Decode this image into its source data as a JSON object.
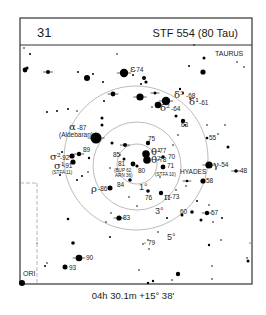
{
  "header": {
    "chart_number": "31",
    "title": "STF 554 (80 Tau)"
  },
  "caption": "04h 30.1m  +15° 38'",
  "constellations": {
    "main": "TAURUS",
    "neighbor": "ORI",
    "cluster": "HYADES"
  },
  "circles": {
    "center": [
      137,
      163
    ],
    "rings": [
      {
        "label": "1°",
        "r": 20
      },
      {
        "label": "3°",
        "r": 44
      },
      {
        "label": "5°",
        "r": 71
      }
    ]
  },
  "labels": {
    "epsilon": {
      "greek": "ε",
      "num": "-74"
    },
    "delta3": {
      "greek": "δ³",
      "num": "-68"
    },
    "delta2": {
      "greek": "δ²",
      "num": "-64"
    },
    "delta1": {
      "greek": "δ¹",
      "num": "-61"
    },
    "alpha": {
      "greek": "α",
      "num": "-87",
      "name": "(Aldebaran)"
    },
    "sigma2": {
      "greek": "σ²",
      "num": "-92"
    },
    "sigma1": {
      "greek": "σ¹",
      "num": "-91",
      "name": "(STFA 11)"
    },
    "rho": {
      "greek": "ρ",
      "num": "-86"
    },
    "theta1": {
      "greek": "θ¹",
      "num": "-77"
    },
    "theta2": {
      "greek": "θ²",
      "num": "-78"
    },
    "gamma": {
      "greek": "γ",
      "num": "-54"
    },
    "pi": {
      "greek": "π",
      "num": "-73"
    },
    "n89": "89",
    "n85": "85",
    "n81": "81",
    "n80": "80",
    "n84": "84",
    "n75": "75",
    "n70": "70",
    "n71": "71",
    "n63": "63",
    "n55": "55",
    "n48": "48",
    "n58": "58",
    "n76": "76",
    "n60": "60",
    "n57": "57",
    "n83": "83",
    "n79": "79",
    "n90": "90",
    "n93": "93",
    "bup": "(BUP 62,",
    "arn": "ARN 36)",
    "stfa10": "(STFA 10)"
  },
  "stars": [
    {
      "x": 124,
      "y": 73,
      "r": 4.2,
      "tick": true
    },
    {
      "x": 133,
      "y": 75,
      "r": 1
    },
    {
      "x": 144,
      "y": 78,
      "r": 2
    },
    {
      "x": 146,
      "y": 82,
      "r": 1.6
    },
    {
      "x": 141,
      "y": 84,
      "r": 1
    },
    {
      "x": 189,
      "y": 66,
      "r": 1
    },
    {
      "x": 204,
      "y": 58,
      "r": 1.5
    },
    {
      "x": 203,
      "y": 72,
      "r": 2.6
    },
    {
      "x": 237,
      "y": 62,
      "r": 0.8
    },
    {
      "x": 244,
      "y": 67,
      "r": 0.8
    },
    {
      "x": 24,
      "y": 48,
      "r": 0.8
    },
    {
      "x": 30,
      "y": 54,
      "r": 1
    },
    {
      "x": 117,
      "y": 54,
      "r": 0.8
    },
    {
      "x": 194,
      "y": 45,
      "r": 0.8
    },
    {
      "x": 25,
      "y": 70,
      "r": 2.4
    },
    {
      "x": 27,
      "y": 68,
      "r": 1.6
    },
    {
      "x": 48,
      "y": 72,
      "r": 2,
      "tick": true
    },
    {
      "x": 78,
      "y": 72,
      "r": 1
    },
    {
      "x": 87,
      "y": 78,
      "r": 3
    },
    {
      "x": 93,
      "y": 74,
      "r": 1
    },
    {
      "x": 103,
      "y": 82,
      "r": 1
    },
    {
      "x": 113,
      "y": 94,
      "r": 2.4,
      "tick": true
    },
    {
      "x": 104,
      "y": 101,
      "r": 1
    },
    {
      "x": 155,
      "y": 93,
      "r": 1.5,
      "tick": true
    },
    {
      "x": 140,
      "y": 97,
      "r": 3.6,
      "tick": true
    },
    {
      "x": 180,
      "y": 89,
      "r": 1.2
    },
    {
      "x": 183,
      "y": 93,
      "r": 1
    },
    {
      "x": 190,
      "y": 99,
      "r": 0.8
    },
    {
      "x": 158,
      "y": 105,
      "r": 3.3
    },
    {
      "x": 166,
      "y": 101,
      "r": 4.2,
      "tick": true
    },
    {
      "x": 152,
      "y": 107,
      "r": 0.8
    },
    {
      "x": 47,
      "y": 112,
      "r": 1
    },
    {
      "x": 57,
      "y": 111,
      "r": 1
    },
    {
      "x": 68,
      "y": 109,
      "r": 1
    },
    {
      "x": 77,
      "y": 111,
      "r": 0.8
    },
    {
      "x": 102,
      "y": 118,
      "r": 1.5
    },
    {
      "x": 102,
      "y": 125,
      "r": 1.5
    },
    {
      "x": 176,
      "y": 116,
      "r": 1.5
    },
    {
      "x": 183,
      "y": 121,
      "r": 2.2
    },
    {
      "x": 185,
      "y": 125,
      "r": 1
    },
    {
      "x": 178,
      "y": 135,
      "r": 0.8
    },
    {
      "x": 207,
      "y": 125,
      "r": 0.8
    },
    {
      "x": 225,
      "y": 125,
      "r": 0.8
    },
    {
      "x": 207,
      "y": 138,
      "r": 1.3
    },
    {
      "x": 218,
      "y": 134,
      "r": 0.8
    },
    {
      "x": 228,
      "y": 147,
      "r": 1.5
    },
    {
      "x": 96,
      "y": 138,
      "r": 5.5,
      "tick": true
    },
    {
      "x": 112,
      "y": 143,
      "r": 1.5
    },
    {
      "x": 79,
      "y": 154,
      "r": 2.2,
      "tick": true
    },
    {
      "x": 89,
      "y": 158,
      "r": 1.2
    },
    {
      "x": 72,
      "y": 156,
      "r": 2.6
    },
    {
      "x": 73,
      "y": 162,
      "r": 2.6
    },
    {
      "x": 62,
      "y": 152,
      "r": 1
    },
    {
      "x": 125,
      "y": 145,
      "r": 2,
      "tick": true
    },
    {
      "x": 148,
      "y": 143,
      "r": 2.2
    },
    {
      "x": 120,
      "y": 155,
      "r": 0.8
    },
    {
      "x": 124,
      "y": 159,
      "r": 1.5
    },
    {
      "x": 133,
      "y": 164,
      "r": 2.4
    },
    {
      "x": 137,
      "y": 166,
      "r": 1.6
    },
    {
      "x": 146,
      "y": 154,
      "r": 3.8
    },
    {
      "x": 147,
      "y": 160,
      "r": 3.8
    },
    {
      "x": 163,
      "y": 157,
      "r": 1.8
    },
    {
      "x": 163,
      "y": 167,
      "r": 2.4
    },
    {
      "x": 173,
      "y": 145,
      "r": 0.8
    },
    {
      "x": 160,
      "y": 177,
      "r": 0.8
    },
    {
      "x": 209,
      "y": 165,
      "r": 3.6,
      "tick": true
    },
    {
      "x": 236,
      "y": 171,
      "r": 1.8,
      "tick": true
    },
    {
      "x": 203,
      "y": 181,
      "r": 2.6
    },
    {
      "x": 187,
      "y": 181,
      "r": 1.3,
      "tick": true
    },
    {
      "x": 186,
      "y": 186,
      "r": 0.8
    },
    {
      "x": 176,
      "y": 190,
      "r": 0.8
    },
    {
      "x": 130,
      "y": 180,
      "r": 1.8
    },
    {
      "x": 110,
      "y": 168,
      "r": 0.8
    },
    {
      "x": 82,
      "y": 176,
      "r": 1
    },
    {
      "x": 88,
      "y": 172,
      "r": 0.8
    },
    {
      "x": 77,
      "y": 180,
      "r": 1
    },
    {
      "x": 60,
      "y": 175,
      "r": 1
    },
    {
      "x": 110,
      "y": 188,
      "r": 2.5
    },
    {
      "x": 148,
      "y": 191,
      "r": 1.8
    },
    {
      "x": 161,
      "y": 193,
      "r": 2.2
    },
    {
      "x": 129,
      "y": 197,
      "r": 0.8
    },
    {
      "x": 137,
      "y": 206,
      "r": 0.8
    },
    {
      "x": 197,
      "y": 201,
      "r": 1
    },
    {
      "x": 209,
      "y": 205,
      "r": 0.8
    },
    {
      "x": 192,
      "y": 212,
      "r": 1.8
    },
    {
      "x": 207,
      "y": 213,
      "r": 2.2,
      "tick": true
    },
    {
      "x": 201,
      "y": 220,
      "r": 1.5
    },
    {
      "x": 222,
      "y": 218,
      "r": 1
    },
    {
      "x": 213,
      "y": 222,
      "r": 0.8
    },
    {
      "x": 182,
      "y": 215,
      "r": 1.5
    },
    {
      "x": 111,
      "y": 213,
      "r": 0.8
    },
    {
      "x": 119,
      "y": 218,
      "r": 2.6,
      "tick": true
    },
    {
      "x": 167,
      "y": 218,
      "r": 1
    },
    {
      "x": 158,
      "y": 232,
      "r": 0.8
    },
    {
      "x": 106,
      "y": 222,
      "r": 0.8
    },
    {
      "x": 149,
      "y": 249,
      "r": 0.8
    },
    {
      "x": 148,
      "y": 240,
      "r": 0.8
    },
    {
      "x": 143,
      "y": 244,
      "r": 0.8
    },
    {
      "x": 110,
      "y": 237,
      "r": 1
    },
    {
      "x": 145,
      "y": 243,
      "r": 0.6
    },
    {
      "x": 68,
      "y": 219,
      "r": 1.3
    },
    {
      "x": 73,
      "y": 243,
      "r": 1.8
    },
    {
      "x": 79,
      "y": 258,
      "r": 3.3,
      "tick": true
    },
    {
      "x": 65,
      "y": 267,
      "r": 2.5
    },
    {
      "x": 45,
      "y": 266,
      "r": 1
    },
    {
      "x": 47,
      "y": 263,
      "r": 0.8
    },
    {
      "x": 37,
      "y": 243,
      "r": 0.6
    },
    {
      "x": 139,
      "y": 270,
      "r": 0.8
    },
    {
      "x": 178,
      "y": 274,
      "r": 2.2
    },
    {
      "x": 172,
      "y": 280,
      "r": 0.8
    },
    {
      "x": 212,
      "y": 279,
      "r": 0.8
    },
    {
      "x": 248,
      "y": 261,
      "r": 1.5
    },
    {
      "x": 247,
      "y": 258,
      "r": 0.8
    },
    {
      "x": 148,
      "y": 283,
      "r": 1.2
    },
    {
      "x": 153,
      "y": 281,
      "r": 1.2
    },
    {
      "x": 221,
      "y": 240,
      "r": 0.8
    },
    {
      "x": 209,
      "y": 245,
      "r": 1.2
    },
    {
      "x": 250,
      "y": 243,
      "r": 0.6
    },
    {
      "x": 212,
      "y": 266,
      "r": 0.8
    },
    {
      "x": 22,
      "y": 283,
      "r": 3
    }
  ]
}
